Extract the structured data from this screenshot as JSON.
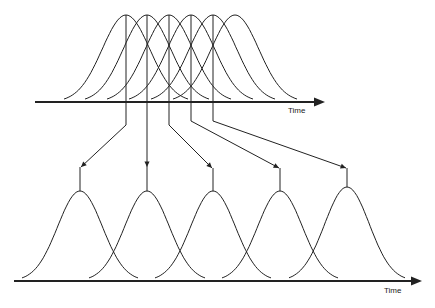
{
  "diagram": {
    "top_axis": {
      "label": "Time",
      "y": 102,
      "x_start": 35,
      "x_end": 325
    },
    "bottom_axis": {
      "label": "Time",
      "y": 281,
      "x_start": 14,
      "x_end": 422
    },
    "top_pulses": {
      "peaks_x": [
        126,
        147,
        169,
        191,
        213,
        235
      ],
      "peak_y": 15,
      "half_width": 62
    },
    "bottom_pulses": {
      "peaks_x": [
        80,
        147,
        213,
        280,
        347
      ],
      "peak_y": [
        191,
        191,
        191,
        191,
        187
      ],
      "half_width": 58
    },
    "leaders": [
      {
        "from_x": 126,
        "bend_y": 125,
        "to_x": 81,
        "arrow_y": 167
      },
      {
        "from_x": 147,
        "bend_y": 125,
        "to_x": 147,
        "arrow_y": 167
      },
      {
        "from_x": 169,
        "bend_y": 125,
        "to_x": 212,
        "arrow_y": 168
      },
      {
        "from_x": 191,
        "bend_y": 121,
        "to_x": 279,
        "arrow_y": 168
      },
      {
        "from_x": 213,
        "bend_y": 121,
        "to_x": 346,
        "arrow_y": 168
      }
    ],
    "stroke_color": "#222222"
  }
}
